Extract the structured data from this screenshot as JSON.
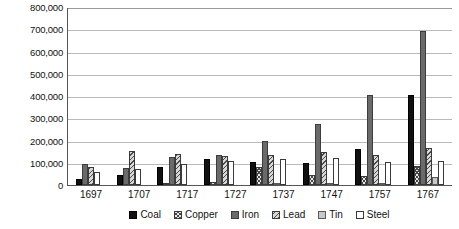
{
  "chart_data": {
    "type": "bar",
    "title": "",
    "xlabel": "",
    "ylabel": "",
    "ylim": [
      0,
      800000
    ],
    "ytick_labels": [
      "800,000",
      "700,000",
      "600,000",
      "500,000",
      "400,000",
      "300,000",
      "200,000",
      "100,000",
      "0"
    ],
    "ytick_values": [
      800000,
      700000,
      600000,
      500000,
      400000,
      300000,
      200000,
      100000,
      0
    ],
    "grid": true,
    "legend_position": "bottom",
    "categories": [
      "1697",
      "1707",
      "1717",
      "1727",
      "1737",
      "1747",
      "1757",
      "1767"
    ],
    "series": [
      {
        "name": "Coal",
        "color": "#111111",
        "pattern": "solid-black",
        "values": [
          25000,
          45000,
          80000,
          115000,
          105000,
          100000,
          160000,
          405000
        ]
      },
      {
        "name": "Copper",
        "color": "#e9e9e9",
        "pattern": "cross-hatch",
        "values": [
          0,
          0,
          10000,
          12000,
          80000,
          45000,
          40000,
          85000
        ]
      },
      {
        "name": "Iron",
        "color": "#6a6a6a",
        "pattern": "solid-gray",
        "values": [
          95000,
          75000,
          125000,
          135000,
          200000,
          275000,
          405000,
          690000
        ]
      },
      {
        "name": "Lead",
        "color": "#d8d8d8",
        "pattern": "diagonal-hatch",
        "values": [
          80000,
          155000,
          140000,
          130000,
          135000,
          150000,
          135000,
          165000
        ]
      },
      {
        "name": "Tin",
        "color": "#c8c8c8",
        "pattern": "solid-light-gray",
        "values": [
          0,
          0,
          0,
          0,
          5000,
          10000,
          5000,
          35000
        ]
      },
      {
        "name": "Steel",
        "color": "#ffffff",
        "pattern": "open-outline",
        "values": [
          60000,
          70000,
          95000,
          110000,
          115000,
          120000,
          105000,
          110000
        ]
      }
    ]
  },
  "legend": {
    "items": [
      {
        "label": "Coal"
      },
      {
        "label": "Copper"
      },
      {
        "label": "Iron"
      },
      {
        "label": "Lead"
      },
      {
        "label": "Tin"
      },
      {
        "label": "Steel"
      }
    ]
  }
}
